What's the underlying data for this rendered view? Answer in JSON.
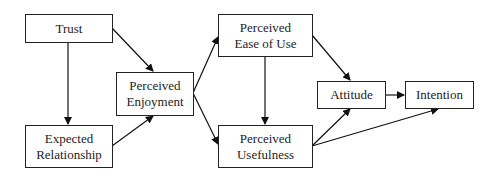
{
  "diagram": {
    "nodes": [
      {
        "id": "trust",
        "label": "Trust"
      },
      {
        "id": "expected_relationship",
        "label": "Expected\nRelationship"
      },
      {
        "id": "perceived_enjoyment",
        "label": "Perceived\nEnjoyment"
      },
      {
        "id": "perceived_ease_of_use",
        "label": "Perceived\nEase of Use"
      },
      {
        "id": "perceived_usefulness",
        "label": "Perceived\nUsefulness"
      },
      {
        "id": "attitude",
        "label": "Attitude"
      },
      {
        "id": "intention",
        "label": "Intention"
      }
    ],
    "edges": [
      {
        "from": "trust",
        "to": "expected_relationship"
      },
      {
        "from": "trust",
        "to": "perceived_enjoyment"
      },
      {
        "from": "expected_relationship",
        "to": "perceived_enjoyment"
      },
      {
        "from": "perceived_enjoyment",
        "to": "perceived_ease_of_use"
      },
      {
        "from": "perceived_enjoyment",
        "to": "perceived_usefulness"
      },
      {
        "from": "perceived_ease_of_use",
        "to": "perceived_usefulness"
      },
      {
        "from": "perceived_ease_of_use",
        "to": "attitude"
      },
      {
        "from": "perceived_usefulness",
        "to": "attitude"
      },
      {
        "from": "perceived_usefulness",
        "to": "intention"
      },
      {
        "from": "attitude",
        "to": "intention"
      }
    ]
  }
}
